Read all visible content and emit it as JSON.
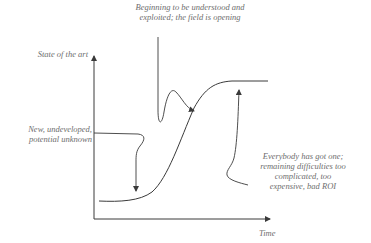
{
  "diagram": {
    "type": "technology-s-curve",
    "axes": {
      "y_label": "State of the art",
      "x_label": "Time"
    },
    "annotations": {
      "top": {
        "line1": "Beginning to be understood and",
        "line2": "exploited; the field is opening"
      },
      "left": {
        "line1": "New, undeveloped,",
        "line2": "potential unknown"
      },
      "right": {
        "line1": "Everybody has got one;",
        "line2": "remaining difficulties too",
        "line3": "complicated, too",
        "line4": "expensive, bad ROI"
      }
    },
    "colors": {
      "line": "#3a3a3a",
      "text": "#6e6e6e",
      "background": "#ffffff"
    }
  }
}
